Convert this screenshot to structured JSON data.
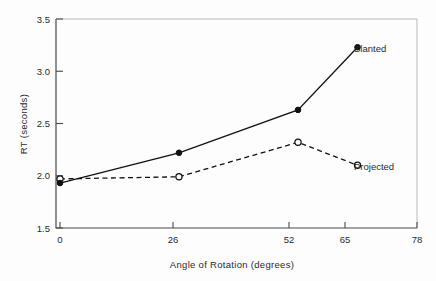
{
  "chart_data": {
    "type": "line",
    "title": "",
    "xlabel": "Angle of Rotation (degrees)",
    "ylabel": "RT (seconds)",
    "xlim": [
      0,
      78
    ],
    "ylim": [
      1.5,
      3.5
    ],
    "xticks": [
      "0",
      "26",
      "52",
      "65",
      "78"
    ],
    "xtick_values": [
      0,
      26,
      52,
      65,
      78
    ],
    "yticks": [
      "3.5",
      "3.0",
      "2.5",
      "2.0",
      "1.5"
    ],
    "ytick_values": [
      3.5,
      3.0,
      2.5,
      2.0,
      1.5
    ],
    "grid": false,
    "legend_position": "inline-right-of-last-point",
    "x": [
      0,
      26,
      52,
      65
    ],
    "series": [
      {
        "name": "Slanted",
        "values": [
          1.93,
          2.22,
          2.63,
          3.23
        ],
        "marker": "filled-circle",
        "linestyle": "solid",
        "color": "#111111"
      },
      {
        "name": "Projected",
        "values": [
          1.97,
          1.99,
          2.32,
          2.1
        ],
        "marker": "open-circle",
        "linestyle": "dashed",
        "color": "#111111"
      }
    ]
  },
  "axis": {
    "y_title": "RT (seconds)",
    "x_title": "Angle of Rotation (degrees)"
  },
  "labels": {
    "slanted": "Slanted",
    "projected": "Projected"
  },
  "colors": {
    "ink": "#111111",
    "axis": "#4a4a4a",
    "background": "#fdfdfd"
  }
}
